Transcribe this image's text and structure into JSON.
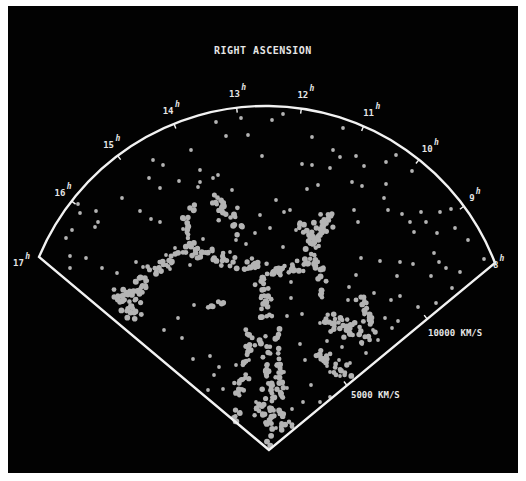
{
  "chart_data": {
    "type": "scatter",
    "subtype": "polar-wedge redshift survey",
    "title": "RIGHT ASCENSION",
    "angular_axis": {
      "label": "RIGHT ASCENSION",
      "unit_superscript": "h",
      "ticks": [
        "17",
        "16",
        "15",
        "14",
        "13",
        "12",
        "11",
        "10",
        "9",
        "8"
      ],
      "range_hours": [
        8,
        17
      ]
    },
    "radial_axis": {
      "unit": "KM/S",
      "tick_labels": [
        "5000 KM/S",
        "10000 KM/S"
      ],
      "ticks": [
        5000,
        10000
      ],
      "range": [
        0,
        15000
      ]
    },
    "colors": {
      "background": "#020202",
      "frame": "#f2f2f2",
      "points": "#b4b4b4",
      "text": "#e6e6e6",
      "page": "#ffffff"
    },
    "grid": false,
    "legend": null,
    "geometry": {
      "apex": [
        269,
        450
      ],
      "corner_left": [
        39,
        257
      ],
      "corner_right": [
        495,
        263
      ],
      "arc_top": [
        266,
        106
      ]
    },
    "filaments": [
      {
        "name": "central-stem",
        "from": [
          262,
          262
        ],
        "to": [
          272,
          447
        ],
        "n": 70,
        "spread": 5
      },
      {
        "name": "stem-left-branch",
        "from": [
          252,
          330
        ],
        "to": [
          232,
          430
        ],
        "n": 40,
        "spread": 4
      },
      {
        "name": "stem-right-branch",
        "from": [
          276,
          330
        ],
        "to": [
          283,
          420
        ],
        "n": 26,
        "spread": 3
      },
      {
        "name": "cross-left-arm",
        "from": [
          262,
          270
        ],
        "to": [
          190,
          247
        ],
        "n": 40,
        "spread": 5
      },
      {
        "name": "left-wall",
        "from": [
          190,
          247
        ],
        "to": [
          118,
          300
        ],
        "n": 44,
        "spread": 6
      },
      {
        "name": "left-cluster",
        "from": [
          118,
          295
        ],
        "to": [
          140,
          312
        ],
        "n": 30,
        "spread": 10
      },
      {
        "name": "left-upper-stream",
        "from": [
          190,
          248
        ],
        "to": [
          188,
          196
        ],
        "n": 16,
        "spread": 4
      },
      {
        "name": "cross-right-arm",
        "from": [
          265,
          275
        ],
        "to": [
          318,
          260
        ],
        "n": 34,
        "spread": 5
      },
      {
        "name": "right-arm-up",
        "from": [
          306,
          250
        ],
        "to": [
          330,
          213
        ],
        "n": 30,
        "spread": 5
      },
      {
        "name": "right-arm-down",
        "from": [
          318,
          260
        ],
        "to": [
          324,
          296
        ],
        "n": 14,
        "spread": 4
      },
      {
        "name": "right-lower-mass",
        "from": [
          330,
          318
        ],
        "to": [
          366,
          336
        ],
        "n": 40,
        "spread": 8
      },
      {
        "name": "right-lower-tail",
        "from": [
          360,
          300
        ],
        "to": [
          374,
          330
        ],
        "n": 18,
        "spread": 4
      },
      {
        "name": "lower-right-stream",
        "from": [
          314,
          352
        ],
        "to": [
          352,
          378
        ],
        "n": 22,
        "spread": 5
      },
      {
        "name": "upper-left-clump",
        "from": [
          212,
          195
        ],
        "to": [
          236,
          225
        ],
        "n": 24,
        "spread": 7
      },
      {
        "name": "upper-right-clump",
        "from": [
          300,
          225
        ],
        "to": [
          322,
          240
        ],
        "n": 16,
        "spread": 6
      },
      {
        "name": "lower-mid-stream",
        "from": [
          206,
          307
        ],
        "to": [
          226,
          302
        ],
        "n": 6,
        "spread": 1.5
      },
      {
        "name": "bottom-cluster",
        "from": [
          262,
          410
        ],
        "to": [
          290,
          430
        ],
        "n": 22,
        "spread": 6
      }
    ],
    "field_points": [
      [
        272,
        120
      ],
      [
        216,
        122
      ],
      [
        248,
        135
      ],
      [
        226,
        136
      ],
      [
        191,
        150
      ],
      [
        312,
        137
      ],
      [
        343,
        128
      ],
      [
        333,
        150
      ],
      [
        340,
        157
      ],
      [
        358,
        125
      ],
      [
        262,
        156
      ],
      [
        153,
        160
      ],
      [
        163,
        165
      ],
      [
        149,
        178
      ],
      [
        179,
        181
      ],
      [
        200,
        182
      ],
      [
        200,
        170
      ],
      [
        198,
        187
      ],
      [
        213,
        178
      ],
      [
        218,
        175
      ],
      [
        302,
        164
      ],
      [
        312,
        165
      ],
      [
        330,
        168
      ],
      [
        356,
        156
      ],
      [
        364,
        166
      ],
      [
        386,
        162
      ],
      [
        396,
        155
      ],
      [
        412,
        171
      ],
      [
        384,
        198
      ],
      [
        386,
        184
      ],
      [
        232,
        190
      ],
      [
        307,
        189
      ],
      [
        318,
        185
      ],
      [
        352,
        182
      ],
      [
        362,
        186
      ],
      [
        354,
        210
      ],
      [
        358,
        222
      ],
      [
        388,
        210
      ],
      [
        402,
        214
      ],
      [
        410,
        222
      ],
      [
        426,
        222
      ],
      [
        414,
        232
      ],
      [
        421,
        212
      ],
      [
        72,
        230
      ],
      [
        80,
        213
      ],
      [
        96,
        211
      ],
      [
        98,
        222
      ],
      [
        95,
        227
      ],
      [
        66,
        238
      ],
      [
        78,
        204
      ],
      [
        122,
        198
      ],
      [
        151,
        219
      ],
      [
        160,
        222
      ],
      [
        70,
        256
      ],
      [
        86,
        258
      ],
      [
        70,
        268
      ],
      [
        102,
        268
      ],
      [
        117,
        273
      ],
      [
        143,
        267
      ],
      [
        135,
        281
      ],
      [
        136,
        262
      ],
      [
        190,
        265
      ],
      [
        170,
        269
      ],
      [
        194,
        305
      ],
      [
        164,
        330
      ],
      [
        178,
        318
      ],
      [
        182,
        338
      ],
      [
        193,
        359
      ],
      [
        219,
        367
      ],
      [
        236,
        365
      ],
      [
        249,
        360
      ],
      [
        223,
        389
      ],
      [
        239,
        392
      ],
      [
        214,
        375
      ],
      [
        208,
        390
      ],
      [
        193,
        392
      ],
      [
        210,
        356
      ],
      [
        440,
        212
      ],
      [
        451,
        209
      ],
      [
        437,
        233
      ],
      [
        455,
        228
      ],
      [
        468,
        240
      ],
      [
        484,
        259
      ],
      [
        434,
        253
      ],
      [
        439,
        262
      ],
      [
        446,
        268
      ],
      [
        431,
        276
      ],
      [
        460,
        272
      ],
      [
        452,
        288
      ],
      [
        458,
        300
      ],
      [
        436,
        303
      ],
      [
        418,
        307
      ],
      [
        398,
        321
      ],
      [
        400,
        296
      ],
      [
        413,
        264
      ],
      [
        400,
        262
      ],
      [
        380,
        261
      ],
      [
        361,
        258
      ],
      [
        356,
        275
      ],
      [
        349,
        287
      ],
      [
        348,
        300
      ],
      [
        374,
        293
      ],
      [
        391,
        300
      ],
      [
        397,
        276
      ],
      [
        283,
        247
      ],
      [
        296,
        230
      ],
      [
        290,
        210
      ],
      [
        284,
        212
      ],
      [
        276,
        200
      ],
      [
        260,
        215
      ],
      [
        291,
        298
      ],
      [
        287,
        316
      ],
      [
        300,
        344
      ],
      [
        305,
        360
      ],
      [
        327,
        366
      ],
      [
        330,
        372
      ],
      [
        340,
        376
      ],
      [
        355,
        390
      ],
      [
        346,
        406
      ],
      [
        320,
        402
      ],
      [
        303,
        402
      ],
      [
        292,
        409
      ],
      [
        276,
        428
      ],
      [
        256,
        402
      ],
      [
        244,
        390
      ],
      [
        240,
        412
      ],
      [
        300,
        110
      ],
      [
        283,
        114
      ],
      [
        260,
        109
      ],
      [
        241,
        118
      ],
      [
        160,
        188
      ],
      [
        140,
        211
      ],
      [
        175,
        248
      ],
      [
        166,
        255
      ],
      [
        183,
        229
      ],
      [
        203,
        239
      ],
      [
        230,
        252
      ],
      [
        246,
        244
      ],
      [
        236,
        240
      ],
      [
        270,
        228
      ],
      [
        255,
        233
      ],
      [
        291,
        282
      ],
      [
        302,
        314
      ],
      [
        320,
        323
      ],
      [
        327,
        341
      ],
      [
        342,
        347
      ],
      [
        362,
        344
      ],
      [
        373,
        330
      ],
      [
        385,
        318
      ],
      [
        392,
        328
      ],
      [
        378,
        340
      ],
      [
        366,
        353
      ],
      [
        350,
        363
      ],
      [
        339,
        360
      ],
      [
        311,
        385
      ],
      [
        316,
        413
      ],
      [
        330,
        397
      ],
      [
        284,
        372
      ],
      [
        287,
        388
      ]
    ]
  }
}
